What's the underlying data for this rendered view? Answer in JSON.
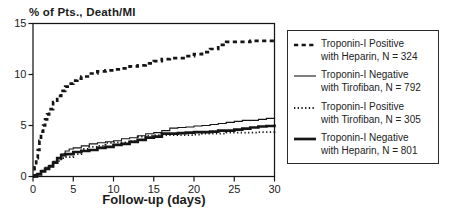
{
  "chart_data": {
    "type": "line",
    "subtype": "step",
    "title": "% of Pts., Death/MI",
    "xlabel": "Follow-up (days)",
    "ylabel": "% of Pts., Death/MI",
    "xlim": [
      0,
      30
    ],
    "ylim": [
      0,
      15
    ],
    "xticks": [
      0,
      5,
      10,
      15,
      20,
      25,
      30
    ],
    "yticks": [
      0,
      5,
      10,
      15
    ],
    "grid": false,
    "legend_position": "right",
    "line_color": "#151515",
    "series": [
      {
        "name": "Troponin-I Positive with Heparin, N = 324",
        "label_lines": [
          "Troponin-I Positive",
          "with Heparin, N = 324"
        ],
        "n": 324,
        "style": "bold-dashed",
        "points": [
          [
            0,
            0
          ],
          [
            0.2,
            0.9
          ],
          [
            0.4,
            1.8
          ],
          [
            0.6,
            2.6
          ],
          [
            0.8,
            3.5
          ],
          [
            1,
            4.4
          ],
          [
            1.25,
            5.0
          ],
          [
            1.5,
            5.6
          ],
          [
            1.75,
            6.1
          ],
          [
            2,
            6.6
          ],
          [
            2.5,
            7.3
          ],
          [
            3,
            7.9
          ],
          [
            3.5,
            8.4
          ],
          [
            4,
            8.8
          ],
          [
            4.5,
            9.1
          ],
          [
            5,
            9.4
          ],
          [
            5.5,
            9.6
          ],
          [
            6,
            9.8
          ],
          [
            7,
            10.1
          ],
          [
            8,
            10.3
          ],
          [
            9,
            10.4
          ],
          [
            10,
            10.5
          ],
          [
            11,
            10.6
          ],
          [
            12,
            10.8
          ],
          [
            13,
            10.9
          ],
          [
            14,
            11.1
          ],
          [
            15,
            11.3
          ],
          [
            16,
            11.5
          ],
          [
            17,
            11.6
          ],
          [
            19,
            11.8
          ],
          [
            20,
            12.0
          ],
          [
            21,
            12.2
          ],
          [
            22,
            12.5
          ],
          [
            23,
            12.9
          ],
          [
            24,
            13.2
          ],
          [
            26,
            13.2
          ],
          [
            27,
            13.3
          ],
          [
            30,
            13.3
          ]
        ]
      },
      {
        "name": "Troponin-I Negative with Tirofiban, N = 792",
        "label_lines": [
          "Troponin-I Negative",
          "with Tirofiban, N = 792"
        ],
        "n": 792,
        "style": "thin-solid",
        "points": [
          [
            0,
            0
          ],
          [
            0.5,
            0.3
          ],
          [
            1,
            0.6
          ],
          [
            1.5,
            0.9
          ],
          [
            2,
            1.1
          ],
          [
            2.5,
            1.5
          ],
          [
            3,
            1.8
          ],
          [
            3.5,
            2.2
          ],
          [
            4,
            2.5
          ],
          [
            4.5,
            2.7
          ],
          [
            5,
            2.8
          ],
          [
            6,
            3.0
          ],
          [
            7,
            3.2
          ],
          [
            8,
            3.3
          ],
          [
            9,
            3.4
          ],
          [
            10,
            3.5
          ],
          [
            11,
            3.7
          ],
          [
            12,
            3.8
          ],
          [
            13,
            4.0
          ],
          [
            14,
            4.2
          ],
          [
            15,
            4.3
          ],
          [
            16,
            4.5
          ],
          [
            17,
            4.75
          ],
          [
            18,
            4.8
          ],
          [
            19,
            4.85
          ],
          [
            20,
            4.95
          ],
          [
            21,
            5.0
          ],
          [
            22,
            5.1
          ],
          [
            23,
            5.2
          ],
          [
            24,
            5.3
          ],
          [
            25,
            5.4
          ],
          [
            26,
            5.5
          ],
          [
            27,
            5.5
          ],
          [
            28,
            5.6
          ],
          [
            29,
            5.7
          ],
          [
            30,
            5.8
          ]
        ]
      },
      {
        "name": "Troponin-I Positive with Tirofiban, N = 305",
        "label_lines": [
          "Troponin-I Positive",
          "with Tirofiban, N = 305"
        ],
        "n": 305,
        "style": "dotted",
        "points": [
          [
            0,
            0
          ],
          [
            0.5,
            0.25
          ],
          [
            1,
            0.5
          ],
          [
            1.5,
            0.8
          ],
          [
            2,
            1.0
          ],
          [
            2.5,
            1.3
          ],
          [
            3,
            1.5
          ],
          [
            3.5,
            1.8
          ],
          [
            4,
            1.9
          ],
          [
            5,
            2.2
          ],
          [
            6,
            2.7
          ],
          [
            7,
            2.9
          ],
          [
            8,
            3.0
          ],
          [
            9,
            3.3
          ],
          [
            10,
            3.35
          ],
          [
            12,
            3.5
          ],
          [
            13,
            3.9
          ],
          [
            14,
            4.0
          ],
          [
            15,
            4.05
          ],
          [
            20,
            4.1
          ],
          [
            21,
            4.2
          ],
          [
            24,
            4.3
          ],
          [
            28,
            4.35
          ],
          [
            30,
            4.5
          ]
        ]
      },
      {
        "name": "Troponin-I Negative with Heparin, N = 801",
        "label_lines": [
          "Troponin-I Negative",
          "with Heparin, N = 801"
        ],
        "n": 801,
        "style": "bold-solid",
        "points": [
          [
            0,
            0
          ],
          [
            0.5,
            0.2
          ],
          [
            1,
            0.5
          ],
          [
            1.5,
            0.75
          ],
          [
            2,
            1.0
          ],
          [
            2.5,
            1.35
          ],
          [
            3,
            1.8
          ],
          [
            3.5,
            2.1
          ],
          [
            4,
            2.2
          ],
          [
            5,
            2.4
          ],
          [
            6,
            2.5
          ],
          [
            7,
            2.6
          ],
          [
            8,
            2.8
          ],
          [
            9,
            2.9
          ],
          [
            10,
            3.1
          ],
          [
            11,
            3.2
          ],
          [
            12,
            3.4
          ],
          [
            13,
            3.6
          ],
          [
            14,
            3.8
          ],
          [
            15,
            3.9
          ],
          [
            16,
            4.2
          ],
          [
            18,
            4.25
          ],
          [
            19,
            4.3
          ],
          [
            20,
            4.35
          ],
          [
            22,
            4.4
          ],
          [
            23,
            4.5
          ],
          [
            25,
            4.6
          ],
          [
            26,
            4.7
          ],
          [
            27,
            4.8
          ],
          [
            28,
            4.9
          ],
          [
            29,
            4.95
          ],
          [
            30,
            5.1
          ]
        ]
      }
    ]
  }
}
